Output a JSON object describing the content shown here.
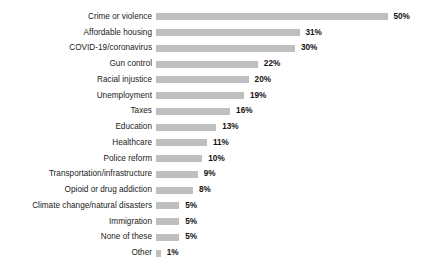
{
  "chart_data": {
    "type": "bar",
    "orientation": "horizontal",
    "title": "",
    "subtitle": "",
    "xlabel": "",
    "ylabel": "",
    "xlim": [
      0,
      50
    ],
    "grid": false,
    "legend": false,
    "bar_color": "#bfbfbf",
    "label_color": "#1a1a1a",
    "value_color": "#111111",
    "background": "#ffffff",
    "value_suffix": "%",
    "categories": [
      "Crime or violence",
      "Affordable housing",
      "COVID-19/coronavirus",
      "Gun control",
      "Racial injustice",
      "Unemployment",
      "Taxes",
      "Education",
      "Healthcare",
      "Police reform",
      "Transportation/infrastructure",
      "Opioid or drug addiction",
      "Climate change/natural disasters",
      "Immigration",
      "None of these",
      "Other"
    ],
    "values": [
      50,
      31,
      30,
      22,
      20,
      19,
      16,
      13,
      11,
      10,
      9,
      8,
      5,
      5,
      5,
      1
    ],
    "value_labels": [
      "50%",
      "31%",
      "30%",
      "22%",
      "20%",
      "19%",
      "16%",
      "13%",
      "11%",
      "10%",
      "9%",
      "8%",
      "5%",
      "5%",
      "5%",
      "1%"
    ]
  }
}
